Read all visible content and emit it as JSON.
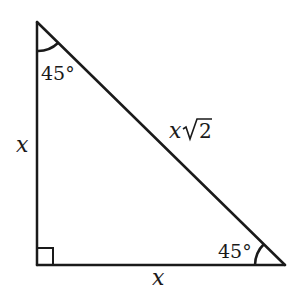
{
  "diagram": {
    "stroke_color": "#1a1a1a",
    "background": "#ffffff",
    "vertices": {
      "top": [
        37,
        22
      ],
      "right_angle": [
        37,
        265
      ],
      "right": [
        285,
        265
      ]
    },
    "labels": {
      "top_angle": "45°",
      "right_angle_label": "45°",
      "left_side": "x",
      "bottom_side": "x",
      "hypotenuse_var": "x",
      "hypotenuse_radical": "2"
    },
    "markers": {
      "right_angle_square": true,
      "top_angle_arc": true,
      "right_angle_arc": true
    }
  }
}
